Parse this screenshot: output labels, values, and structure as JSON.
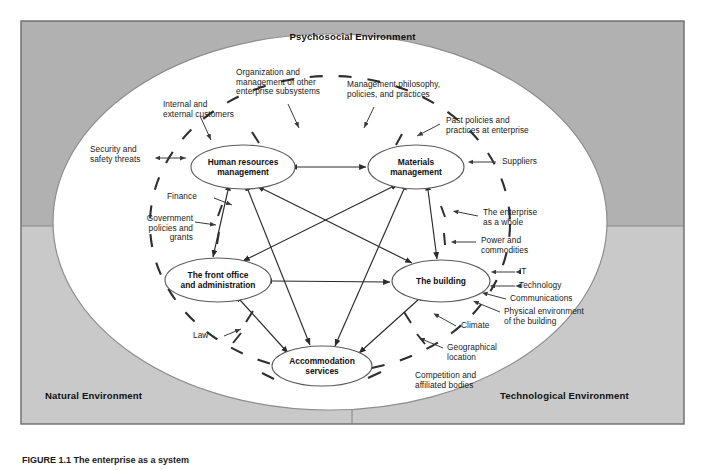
{
  "figure": {
    "title": "Psychosocial Environment",
    "caption": "FIGURE 1.1  The enterprise as a system"
  },
  "colors": {
    "psychosocial_bg": "#b3b3b3",
    "natural_bg": "#c9c9c9",
    "technological_bg": "#c9c9c9",
    "inner_bg": "#ffffff",
    "frame_stroke": "#6b6b6b",
    "line": "#2a2a2a",
    "text": "#1a1a1a"
  },
  "environments": [
    {
      "id": "psychosocial",
      "label": "Psychosocial Environment"
    },
    {
      "id": "natural",
      "label": "Natural Environment"
    },
    {
      "id": "technological",
      "label": "Technological Environment"
    }
  ],
  "nodes": [
    {
      "id": "hr",
      "label": "Human resources\nmanagement",
      "cx": 243,
      "cy": 167,
      "rx": 52,
      "ry": 22
    },
    {
      "id": "materials",
      "label": "Materials\nmanagement",
      "cx": 416,
      "cy": 167,
      "rx": 48,
      "ry": 22
    },
    {
      "id": "frontoffice",
      "label": "The front office\nand administration",
      "cx": 218,
      "cy": 280,
      "rx": 53,
      "ry": 22
    },
    {
      "id": "building",
      "label": "The building",
      "cx": 441,
      "cy": 281,
      "rx": 49,
      "ry": 21
    },
    {
      "id": "accommodation",
      "label": "Accommodation\nservices",
      "cx": 322,
      "cy": 366,
      "rx": 50,
      "ry": 20
    }
  ],
  "connections": [
    {
      "from": "hr",
      "to": "materials"
    },
    {
      "from": "frontoffice",
      "to": "building"
    },
    {
      "from": "hr",
      "to": "frontoffice"
    },
    {
      "from": "materials",
      "to": "building"
    },
    {
      "from": "hr",
      "to": "building"
    },
    {
      "from": "materials",
      "to": "frontoffice"
    },
    {
      "from": "hr",
      "to": "accommodation"
    },
    {
      "from": "materials",
      "to": "accommodation"
    },
    {
      "from": "frontoffice",
      "to": "accommodation"
    },
    {
      "from": "building",
      "to": "accommodation"
    }
  ],
  "external_factors": [
    {
      "id": "organization-management",
      "text": "Organization and\nmanagement of other\nenterprise subsystems",
      "x": 236,
      "y": 68,
      "w": 104,
      "align": "left"
    },
    {
      "id": "management-philosophy",
      "text": "Management philosophy,\npolicies, and practices",
      "x": 347,
      "y": 80,
      "w": 110,
      "align": "left"
    },
    {
      "id": "internal-external-customers",
      "text": "Internal and\nexternal customers",
      "x": 163,
      "y": 100,
      "w": 80,
      "align": "left"
    },
    {
      "id": "past-policies",
      "text": "Past policies and\npractices at enterprise",
      "x": 446,
      "y": 116,
      "w": 92,
      "align": "left"
    },
    {
      "id": "security-safety-threats",
      "text": "Security and\nsafety threats",
      "x": 90,
      "y": 145,
      "w": 66,
      "align": "left"
    },
    {
      "id": "suppliers",
      "text": "Suppliers",
      "x": 502,
      "y": 157,
      "w": 60,
      "align": "left"
    },
    {
      "id": "finance",
      "text": "Finance",
      "x": 167,
      "y": 192,
      "w": 44,
      "align": "left"
    },
    {
      "id": "enterprise-as-a-whole",
      "text": "The enterprise\nas a whole",
      "x": 483,
      "y": 208,
      "w": 80,
      "align": "left"
    },
    {
      "id": "government-policies",
      "text": "Government\npolicies and\ngrants",
      "x": 127,
      "y": 214,
      "w": 64,
      "align": "left"
    },
    {
      "id": "power-commodities",
      "text": "Power and\ncommodities",
      "x": 481,
      "y": 236,
      "w": 70,
      "align": "left"
    },
    {
      "id": "it",
      "text": "IT",
      "x": 519,
      "y": 268,
      "w": 40,
      "align": "left"
    },
    {
      "id": "technology",
      "text": "Technology",
      "x": 519,
      "y": 282,
      "w": 66,
      "align": "left"
    },
    {
      "id": "communications",
      "text": "Communications",
      "x": 510,
      "y": 296,
      "w": 86,
      "align": "left"
    },
    {
      "id": "physical-environment",
      "text": "Physical environment\nof the building",
      "x": 504,
      "y": 308,
      "w": 100,
      "align": "left"
    },
    {
      "id": "climate",
      "text": "Climate",
      "x": 461,
      "y": 322,
      "w": 44,
      "align": "left"
    },
    {
      "id": "law",
      "text": "Law",
      "x": 193,
      "y": 336,
      "w": 30,
      "align": "left"
    },
    {
      "id": "geographical-location",
      "text": "Geographical\nlocation",
      "x": 447,
      "y": 344,
      "w": 70,
      "align": "left"
    },
    {
      "id": "competition-affiliated",
      "text": "Competition and\naffiliated bodies",
      "x": 415,
      "y": 372,
      "w": 84,
      "align": "left"
    }
  ]
}
